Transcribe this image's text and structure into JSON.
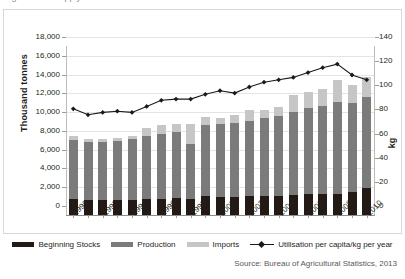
{
  "caption": {
    "text": "Figure: Rice supply and utilisation"
  },
  "axes": {
    "y_title": "Thousand tonnes",
    "y_ticks": [
      "0",
      "2,000",
      "4,000",
      "6,000",
      "8,000",
      "10,000",
      "12,000",
      "14,000",
      "16,000",
      "18,000"
    ],
    "y_values": [
      0,
      2000,
      4000,
      6000,
      8000,
      10000,
      12000,
      14000,
      16000,
      18000
    ],
    "r_title": "kg",
    "r_ticks": [
      "0",
      "20",
      "40",
      "60",
      "80",
      "100",
      "120",
      "140"
    ],
    "r_values": [
      0,
      20,
      40,
      60,
      80,
      100,
      120,
      140
    ],
    "x_ticks": [
      "1990",
      "1992",
      "1994",
      "1996",
      "1998",
      "2000",
      "2002",
      "2004",
      "2006",
      "2008",
      "2010"
    ]
  },
  "legend": {
    "items": [
      {
        "label": "Beginning Stocks",
        "swatch": "sw-stocks",
        "icon": "legend-swatch-icon"
      },
      {
        "label": "Production",
        "swatch": "sw-prod",
        "icon": "legend-swatch-icon"
      },
      {
        "label": "Imports",
        "swatch": "sw-imp",
        "icon": "legend-swatch-icon"
      },
      {
        "label": "Utilisation per capita/kg per year",
        "swatch": "sw-line",
        "icon": "legend-line-marker-icon"
      }
    ]
  },
  "source": {
    "text": "Source: Bureau of Agricultural Statistics, 2013"
  },
  "colors": {
    "stocks": "#231a16",
    "production": "#7b7b7b",
    "imports": "#c6c6c6",
    "line": "#1a1a1a",
    "grid": "#e4e4e4",
    "frame": "#d8d8d8"
  },
  "chart_data": {
    "type": "bar",
    "title": "Rice supply and utilisation",
    "xlabel": "",
    "ylabel": "Thousand tonnes",
    "y2label": "kg",
    "ylim": [
      0,
      18000
    ],
    "y2lim": [
      0,
      140
    ],
    "grid": true,
    "legend_position": "bottom",
    "stacked": true,
    "categories": [
      "1990",
      "1991",
      "1992",
      "1993",
      "1994",
      "1995",
      "1996",
      "1997",
      "1998",
      "1999",
      "2000",
      "2001",
      "2002",
      "2003",
      "2004",
      "2005",
      "2006",
      "2007",
      "2008",
      "2009",
      "2010"
    ],
    "series": [
      {
        "name": "Beginning Stocks",
        "type": "bar",
        "axis": "left",
        "values": [
          1700,
          1600,
          1600,
          1550,
          1650,
          1700,
          1750,
          1800,
          1750,
          2050,
          1950,
          1950,
          2000,
          2000,
          2050,
          2150,
          2200,
          2250,
          2200,
          2400,
          2900
        ]
      },
      {
        "name": "Production",
        "type": "bar",
        "axis": "left",
        "values": [
          6300,
          6200,
          6200,
          6350,
          6400,
          6700,
          6900,
          7000,
          5800,
          7500,
          7700,
          7900,
          8000,
          8300,
          8500,
          8800,
          9200,
          9400,
          9800,
          9500,
          9650
        ]
      },
      {
        "name": "Imports",
        "type": "bar",
        "axis": "left",
        "values": [
          400,
          250,
          250,
          300,
          400,
          900,
          900,
          850,
          2100,
          900,
          700,
          800,
          1200,
          900,
          1000,
          1800,
          1700,
          1800,
          2400,
          1900,
          2200
        ]
      },
      {
        "name": "Utilisation per capita/kg per year",
        "type": "line",
        "axis": "right",
        "values": [
          88,
          83,
          85,
          86,
          85,
          90,
          95,
          96,
          96,
          100,
          103,
          101,
          106,
          110,
          112,
          114,
          118,
          122,
          125,
          116,
          112
        ]
      }
    ]
  }
}
